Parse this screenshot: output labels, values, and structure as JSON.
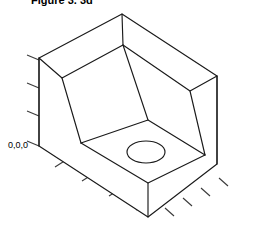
{
  "figure": {
    "title": "Figure 3. 3d",
    "origin_label": "0,0,0",
    "line_color": "#1a1a1a",
    "tick_color": "#3a3a3a",
    "background_color": "#ffffff",
    "fill_color": "#ffffff"
  },
  "geometry": {
    "description": "isometric-block-with-rectangular-pocket-and-circular-hole",
    "outer_block": {
      "top_apex": [
        122,
        14
      ],
      "top_left": [
        39,
        58
      ],
      "top_right": [
        217,
        76
      ],
      "front_vertex": [
        148,
        217
      ],
      "left_bottom": [
        39,
        146
      ],
      "right_bottom": [
        217,
        164
      ]
    },
    "pocket": {
      "apex": [
        123,
        45
      ],
      "left_rim": [
        62,
        78
      ],
      "right_rim": [
        190,
        91
      ],
      "floor_front": [
        148,
        183
      ],
      "floor_left": [
        81,
        143
      ],
      "floor_right": [
        205,
        155
      ]
    },
    "hole": {
      "center": [
        146,
        152
      ],
      "radius_x": 19,
      "radius_y": 11
    }
  },
  "axes": {
    "vertical_tick_count": 4,
    "left_tick_count": 4,
    "right_tick_count": 4
  }
}
